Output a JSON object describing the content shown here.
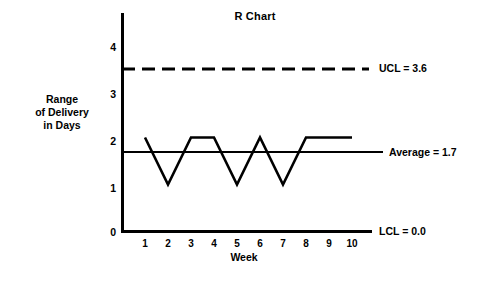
{
  "chart_data": {
    "type": "line",
    "title": "R Chart",
    "xlabel": "Week",
    "ylabel": "Range of Delivery in Days",
    "ylabel_lines": [
      "Range",
      "of Delivery",
      "in Days"
    ],
    "categories": [
      "1",
      "2",
      "3",
      "4",
      "5",
      "6",
      "7",
      "8",
      "9",
      "10"
    ],
    "values": [
      2,
      1,
      2,
      2,
      1,
      2,
      1,
      2,
      2,
      2
    ],
    "series": [
      {
        "name": "Range of Delivery in Days",
        "values": [
          2,
          1,
          2,
          2,
          1,
          2,
          1,
          2,
          2,
          2
        ]
      }
    ],
    "yticks": [
      "0",
      "1",
      "2",
      "3",
      "4"
    ],
    "ytick_values": [
      0,
      1,
      2,
      3,
      4
    ],
    "ylim": [
      0,
      4.6
    ],
    "xlim": [
      0.3,
      10.8
    ],
    "grid": false,
    "legend": "none",
    "control_limits": [
      {
        "id": "ucl",
        "label": "UCL = 3.6",
        "name": "UCL",
        "value": 3.6,
        "style": "dashed"
      },
      {
        "id": "average",
        "label": "Average = 1.7",
        "name": "Average",
        "value": 1.7,
        "style": "solid"
      },
      {
        "id": "lcl",
        "label": "LCL = 0.0",
        "name": "LCL",
        "value": 0.0,
        "style": "solid"
      }
    ],
    "colors": {
      "background": "#ffffff",
      "ink": "#000000",
      "series": "#000000"
    }
  }
}
